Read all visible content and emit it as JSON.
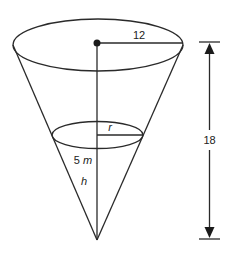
{
  "diagram": {
    "labels": {
      "top_radius": "12",
      "height_total": "18",
      "water_radius": "r",
      "water_depth_number": "5",
      "water_depth_unit": "m",
      "water_height_var": "h"
    },
    "geometry": {
      "top_ellipse": {
        "cx": 98,
        "cy": 45,
        "rx": 85,
        "ry": 26
      },
      "water_ellipse": {
        "cx": 97.5,
        "cy": 135,
        "rx": 45.5,
        "ry": 13.5
      },
      "apex": {
        "x": 97,
        "y": 240
      },
      "center_dot": {
        "x": 97,
        "y": 43,
        "r": 3.5
      },
      "dimension_arrow": {
        "x": 209,
        "y_top": 42,
        "y_bottom": 239,
        "tick_half_width": 10
      }
    },
    "colors": {
      "line": "#2a2a2a",
      "text": "#222222",
      "background": "#ffffff"
    }
  }
}
